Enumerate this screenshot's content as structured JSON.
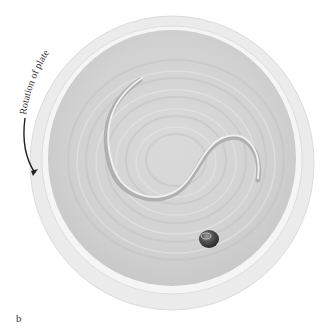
{
  "figure": {
    "panel_label": "b",
    "annotation": "Rotation of plate",
    "colors": {
      "background": "#ffffff",
      "rim_outer": "#e9e9e9",
      "rim_highlight": "#f6f6f6",
      "plate_interior": "#d4d4d4",
      "groove_shadow": "#b9b9b9",
      "ball": "#4a4a4a",
      "arrow": "#222222"
    }
  }
}
